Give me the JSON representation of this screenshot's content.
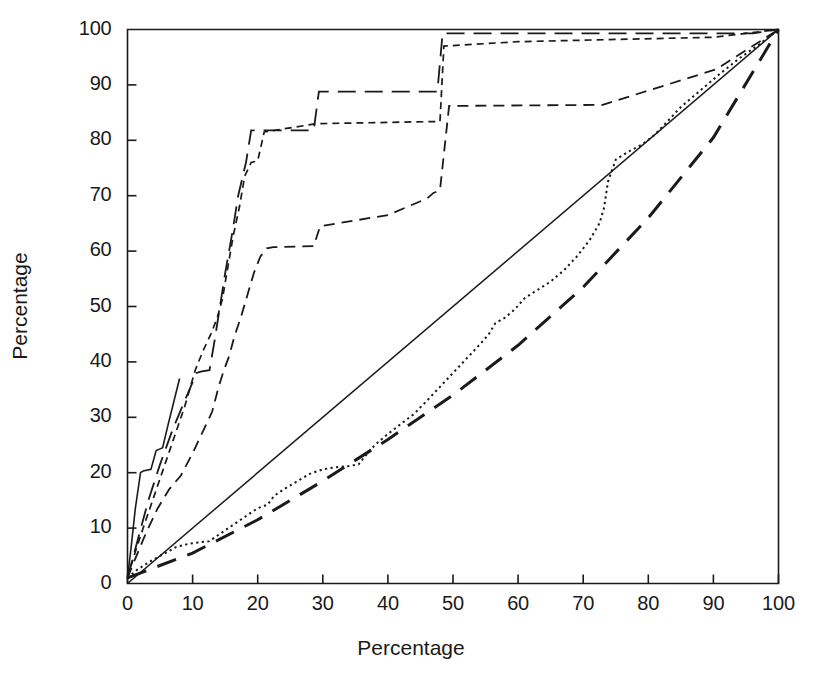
{
  "chart_data": {
    "type": "line",
    "title": "",
    "subtitle": "",
    "xlabel": "Percentage",
    "ylabel": "Percentage",
    "xlim": [
      0,
      100
    ],
    "ylim": [
      0,
      100
    ],
    "xticks": [
      0,
      10,
      20,
      30,
      40,
      50,
      60,
      70,
      80,
      90,
      100
    ],
    "yticks": [
      0,
      10,
      20,
      30,
      40,
      50,
      60,
      70,
      80,
      90,
      100
    ],
    "xtick_labels": [
      "0",
      "10",
      "20",
      "30",
      "40",
      "50",
      "60",
      "70",
      "80",
      "90",
      "100"
    ],
    "ytick_labels": [
      "0",
      "10",
      "20",
      "30",
      "40",
      "50",
      "60",
      "70",
      "80",
      "90",
      "100"
    ],
    "grid": false,
    "legend": "none",
    "annotations": [],
    "axis_color": "#1a1a1a",
    "background_color": "#ffffff",
    "series": [
      {
        "name": "equality-line",
        "style": "solid",
        "dash": "none",
        "stroke_width": 1.5,
        "x": [
          0,
          100
        ],
        "y": [
          0,
          100
        ]
      },
      {
        "name": "series-solid-steep",
        "style": "solid",
        "dash": "none",
        "stroke_width": 1.6,
        "x": [
          0,
          0.6,
          1.2,
          2.0,
          2.4,
          3.6,
          4.4,
          5.0,
          5.4,
          6.2,
          8.0
        ],
        "y": [
          1.0,
          7.0,
          13.5,
          20.0,
          20.3,
          20.6,
          24.0,
          24.3,
          24.5,
          28.5,
          37.0
        ]
      },
      {
        "name": "series-long-dash-steep",
        "style": "long-dash",
        "dash": "18,9",
        "stroke_width": 1.8,
        "x": [
          0,
          1.6,
          3.2,
          5.0,
          7.0,
          8.8,
          10.6,
          11.4,
          12.6,
          13.4,
          14.2,
          15.0,
          16.2,
          17.0,
          18.2,
          19.0,
          28.6,
          29.4,
          47.6,
          48.4,
          96.0,
          100.0
        ],
        "y": [
          1.0,
          8.0,
          15.0,
          21.5,
          28.0,
          33.0,
          38.0,
          38.3,
          38.5,
          44.0,
          50.0,
          56.0,
          64.0,
          70.0,
          76.0,
          81.8,
          81.8,
          88.8,
          88.8,
          99.3,
          99.3,
          100.0
        ]
      },
      {
        "name": "series-short-dash-steep",
        "style": "short-dash",
        "dash": "7,5",
        "stroke_width": 1.7,
        "x": [
          0,
          1.0,
          2.4,
          4.0,
          5.6,
          7.2,
          8.8,
          10.4,
          11.6,
          12.8,
          13.8,
          14.6,
          15.4,
          16.2,
          17.2,
          18.0,
          19.0,
          20.0,
          21.0,
          29.0,
          48.0,
          48.6,
          60.0,
          75.0,
          90.0,
          100.0
        ],
        "y": [
          1.0,
          5.0,
          10.0,
          15.5,
          21.0,
          26.5,
          32.0,
          38.5,
          42.0,
          45.0,
          48.0,
          51.5,
          57.0,
          62.5,
          68.0,
          73.5,
          76.0,
          76.3,
          81.5,
          83.0,
          83.4,
          97.0,
          97.8,
          98.2,
          98.6,
          100.0
        ]
      },
      {
        "name": "series-medium-dash-steep",
        "style": "medium-dash",
        "dash": "11,7",
        "stroke_width": 1.8,
        "x": [
          0,
          1.2,
          2.8,
          4.6,
          6.4,
          8.2,
          10.0,
          11.8,
          13.0,
          14.0,
          14.8,
          15.6,
          16.4,
          17.4,
          18.4,
          19.4,
          20.4,
          21.4,
          22.4,
          28.6,
          29.6,
          40.0,
          46.0,
          47.0,
          48.0,
          49.4,
          73.0,
          90.4,
          100.0
        ],
        "y": [
          1.0,
          4.5,
          9.0,
          13.5,
          17.0,
          19.5,
          23.5,
          28.0,
          31.0,
          35.5,
          38.5,
          41.0,
          44.5,
          48.0,
          52.0,
          56.0,
          59.0,
          60.5,
          60.7,
          60.9,
          64.5,
          66.5,
          69.5,
          70.5,
          71.0,
          86.2,
          86.4,
          92.8,
          100.0
        ]
      },
      {
        "name": "series-dotted-lower",
        "style": "dotted",
        "dash": "2.2,3.4",
        "stroke_width": 2.0,
        "x": [
          0,
          1.5,
          3.5,
          5.5,
          7.5,
          9.5,
          11.5,
          12.5,
          14.0,
          16.0,
          18.0,
          20.0,
          21.5,
          22.5,
          24.0,
          26.0,
          28.0,
          30.0,
          32.0,
          34.0,
          35.5,
          36.5,
          38.0,
          40.0,
          42.0,
          44.0,
          46.0,
          48.0,
          50.0,
          52.0,
          54.0,
          55.5,
          56.5,
          58.0,
          59.5,
          61.0,
          63.0,
          65.0,
          67.0,
          69.0,
          71.0,
          72.5,
          73.2,
          73.8,
          75.0,
          77.0,
          79.0,
          81.0,
          83.0,
          85.0,
          88.0,
          91.0,
          94.0,
          97.0,
          100.0
        ],
        "y": [
          1.0,
          2.5,
          4.0,
          5.3,
          6.6,
          7.2,
          7.5,
          7.6,
          8.8,
          10.4,
          12.0,
          13.6,
          14.2,
          15.8,
          17.0,
          18.4,
          19.8,
          20.6,
          21.0,
          21.2,
          21.5,
          23.0,
          25.0,
          27.0,
          28.8,
          30.6,
          33.0,
          35.5,
          38.0,
          40.5,
          43.0,
          45.0,
          47.0,
          48.0,
          49.5,
          51.5,
          53.0,
          54.5,
          56.5,
          59.0,
          62.0,
          65.0,
          67.8,
          72.5,
          76.5,
          78.0,
          79.2,
          81.0,
          83.5,
          86.0,
          89.0,
          92.0,
          94.8,
          97.3,
          100.0
        ]
      },
      {
        "name": "series-thick-long-dash-lower",
        "style": "thick-long-dash",
        "dash": "20,12",
        "stroke_width": 3.0,
        "x": [
          0,
          10,
          20,
          30,
          40,
          50,
          60,
          70,
          80,
          90,
          100
        ],
        "y": [
          1.0,
          5.5,
          11.5,
          18.5,
          26.0,
          34.0,
          43.0,
          53.5,
          66.0,
          80.5,
          100.0
        ]
      }
    ]
  },
  "axis_labels": {
    "x": "Percentage",
    "y": "Percentage"
  }
}
